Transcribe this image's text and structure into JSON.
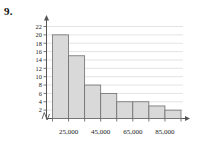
{
  "problem": {
    "number": "9."
  },
  "chart_data": {
    "type": "bar",
    "title": "",
    "xlabel": "",
    "ylabel": "",
    "ylim": [
      0,
      23
    ],
    "grid": true,
    "legend": null,
    "axis_break": true,
    "categories": [
      "15,000",
      "25,000",
      "35,000",
      "45,000",
      "55,000",
      "65,000",
      "75,000",
      "85,000"
    ],
    "values": [
      20,
      15,
      8,
      6,
      4,
      4,
      3,
      2
    ],
    "ytick_labels": [
      "2",
      "4",
      "6",
      "8",
      "10",
      "12",
      "14",
      "16",
      "18",
      "20",
      "22"
    ],
    "ytick_values": [
      2,
      4,
      6,
      8,
      10,
      12,
      14,
      16,
      18,
      20,
      22
    ],
    "xtick_labels": [
      "25,000",
      "45,000",
      "65,000",
      "85,000"
    ],
    "xtick_label_positions": [
      1,
      3,
      5,
      7
    ],
    "colors": {
      "bar_fill": "#d9d9d9",
      "bar_stroke": "#6f6f6f",
      "grid": "#c9c9c9",
      "axis": "#555555"
    }
  }
}
